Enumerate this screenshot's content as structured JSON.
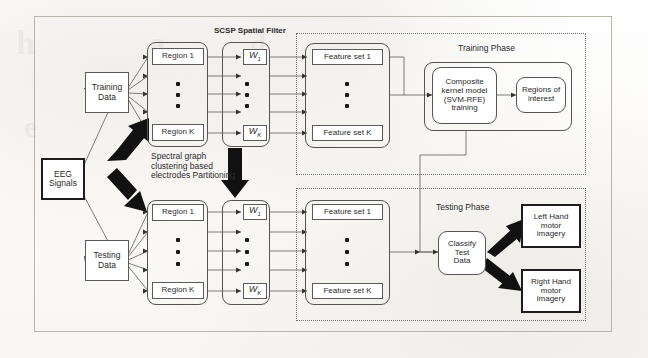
{
  "figure": {
    "type": "flow-diagram"
  },
  "nodes": {
    "eeg_signals": "EEG\nSignals",
    "eeg_signals_l1": "EEG",
    "eeg_signals_l2": "Signals",
    "training_data_l1": "Training",
    "training_data_l2": "Data",
    "testing_data_l1": "Testing",
    "testing_data_l2": "Data",
    "region_first": "Region 1",
    "region_last": "Region K",
    "w_first": "W",
    "w_first_sub": "1",
    "w_last": "W",
    "w_last_sub": "K",
    "feature_first": "Feature set 1",
    "feature_last": "Feature set K",
    "composite_kernel_l1": "Composite",
    "composite_kernel_l2": "kernel model",
    "composite_kernel_l3": "(SVM-RFE)",
    "composite_kernel_l4": "training",
    "regions_of_interest_l1": "Regions of",
    "regions_of_interest_l2": "interest",
    "classify_l1": "Classify",
    "classify_l2": "Test",
    "classify_l3": "Data",
    "left_hand_l1": "Left Hand",
    "left_hand_l2": "motor",
    "left_hand_l3": "imagery",
    "right_hand_l1": "Right Hand",
    "right_hand_l2": "motor",
    "right_hand_l3": "imagery"
  },
  "labels": {
    "scsp_filter": "SCSP Spatial Filter",
    "training_phase": "Training Phase",
    "testing_phase": "Testing Phase",
    "spectral_l1": "Spectral graph",
    "spectral_l2": "clustering based",
    "spectral_l3": "electrodes Partitioning"
  },
  "ghost_text": {
    "g1": "h",
    "g2": "a",
    "g3": "d",
    "g4": "e"
  },
  "colors": {
    "ink": "#2b2b2b",
    "line": "#6e6e6e",
    "heavy": "#111111",
    "frame": "#b9b5ad",
    "dotted": "#6f6f6f",
    "paper": "#fdfdfc"
  }
}
